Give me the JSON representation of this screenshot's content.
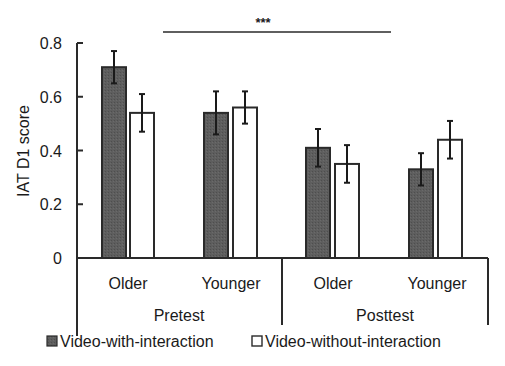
{
  "chart_data": {
    "type": "bar",
    "title": "",
    "xlabel": "",
    "ylabel": "IAT D1 score",
    "ylim": [
      0,
      0.8
    ],
    "yticks": [
      "0",
      "0.2",
      "0.4",
      "0.6",
      "0.8"
    ],
    "grid": false,
    "legend_position": "bottom",
    "groups": [
      {
        "label": "Pretest",
        "categories": [
          "Older",
          "Younger"
        ]
      },
      {
        "label": "Posttest",
        "categories": [
          "Older",
          "Younger"
        ]
      }
    ],
    "categories": [
      "Pretest Older",
      "Pretest Younger",
      "Posttest Older",
      "Posttest Younger"
    ],
    "series": [
      {
        "name": "Video-with-interaction",
        "color": "#5a5a5a",
        "values": [
          0.71,
          0.54,
          0.41,
          0.33
        ],
        "errors": [
          0.06,
          0.08,
          0.07,
          0.06
        ]
      },
      {
        "name": "Video-without-interaction",
        "color": "#ffffff",
        "values": [
          0.54,
          0.56,
          0.35,
          0.44
        ],
        "errors": [
          0.07,
          0.06,
          0.07,
          0.07
        ]
      }
    ],
    "annotations": [
      {
        "text": "***",
        "spans": "Pretest vs Posttest"
      }
    ]
  }
}
